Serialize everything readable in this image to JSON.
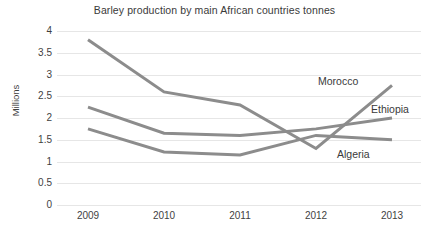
{
  "chart_data": {
    "type": "line",
    "title": "Barley production by main African countries tonnes",
    "xlabel": "",
    "ylabel": "Millions",
    "categories": [
      "2009",
      "2010",
      "2011",
      "2012",
      "2013"
    ],
    "x": [
      2009,
      2010,
      2011,
      2012,
      2013
    ],
    "ylim": [
      0,
      4
    ],
    "yticks": [
      "0",
      "0.5",
      "1",
      "1.5",
      "2",
      "2.5",
      "3",
      "3.5",
      "4"
    ],
    "ytick_values": [
      0,
      0.5,
      1,
      1.5,
      2,
      2.5,
      3,
      3.5,
      4
    ],
    "grid": true,
    "legend_position": "inline-right",
    "series": [
      {
        "name": "Morocco",
        "values": [
          3.8,
          2.6,
          2.3,
          1.3,
          2.75
        ],
        "color": "#8c8c8c",
        "label_x": 318,
        "label_y": 76
      },
      {
        "name": "Ethiopia",
        "values": [
          2.25,
          1.65,
          1.6,
          1.75,
          2.0
        ],
        "color": "#8c8c8c",
        "label_x": 371,
        "label_y": 104
      },
      {
        "name": "Algeria",
        "values": [
          1.75,
          1.22,
          1.15,
          1.6,
          1.5
        ],
        "color": "#8c8c8c",
        "label_x": 337,
        "label_y": 149
      }
    ]
  },
  "colors": {
    "background": "#ffffff",
    "gridline": "#e6e6e6",
    "text": "#3a3a3a",
    "line": "#8c8c8c"
  }
}
